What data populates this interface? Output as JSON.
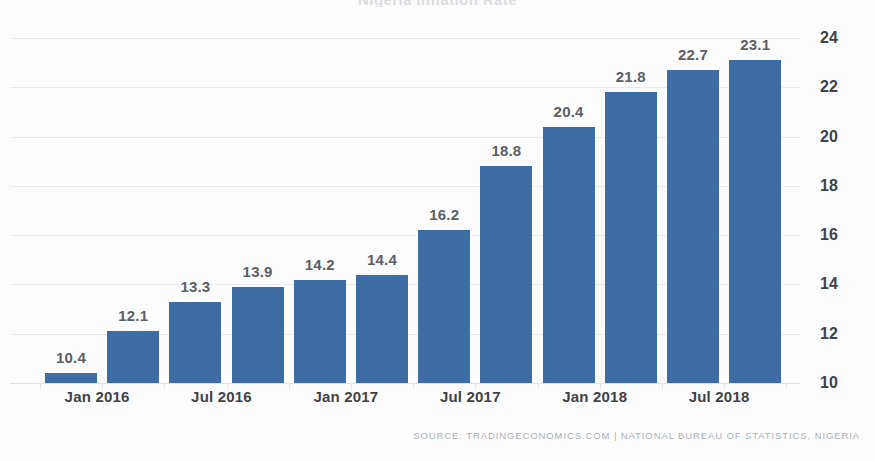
{
  "chart_data": {
    "type": "bar",
    "title": "Nigeria Inflation Rate",
    "categories": [
      "Jan 2016",
      "Apr 2016",
      "Jul 2016",
      "Oct 2016",
      "Jan 2017",
      "Apr 2017",
      "Jul 2017",
      "Oct 2017",
      "Jan 2018",
      "Apr 2018",
      "Jul 2018",
      "Oct 2018"
    ],
    "values": [
      10.4,
      12.1,
      13.3,
      13.9,
      14.2,
      14.4,
      16.2,
      18.8,
      20.4,
      21.8,
      22.7,
      23.1
    ],
    "point_labels": [
      "10.4",
      "12.1",
      "13.3",
      "13.9",
      "14.2",
      "14.4",
      "16.2",
      "18.8",
      "20.4",
      "21.8",
      "22.7",
      "23.1"
    ],
    "xlabel": "",
    "ylabel": "",
    "ylim": [
      10,
      24
    ],
    "y_ticks": [
      10,
      12,
      14,
      16,
      18,
      20,
      22,
      24
    ],
    "y_tick_labels": [
      "10",
      "12",
      "14",
      "16",
      "18",
      "20",
      "22",
      "24"
    ],
    "x_tick_labels": [
      "Jan 2016",
      "Jul 2016",
      "Jan 2017",
      "Jul 2017",
      "Jan 2018",
      "Jul 2018"
    ],
    "grid": true,
    "legend": false,
    "y_axis_position": "right",
    "bar_color": "#3d6da4",
    "grid_color": "#e9ecef",
    "label_color": "#5b5f66"
  },
  "footer": {
    "source": "SOURCE: TRADINGECONOMICS.COM  |  NATIONAL BUREAU OF STATISTICS, NIGERIA"
  }
}
